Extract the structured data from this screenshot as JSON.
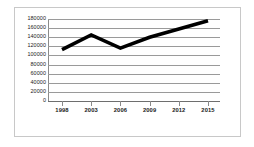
{
  "chart_data": {
    "type": "line",
    "title": "",
    "subtitle": "",
    "xlabel": "",
    "ylabel": "",
    "categories": [
      "1998",
      "2003",
      "2006",
      "2009",
      "2012",
      "2015"
    ],
    "x": [
      1998,
      2003,
      2006,
      2009,
      2012,
      2015
    ],
    "series": [
      {
        "name": "",
        "values": [
          113000,
          145000,
          116000,
          140000,
          158000,
          176000
        ]
      }
    ],
    "values": [
      113000,
      145000,
      116000,
      140000,
      158000,
      176000
    ],
    "ylim": [
      0,
      180000
    ],
    "ytick_labels": [
      "180000",
      "160000",
      "140000",
      "120000",
      "100000",
      "80000",
      "60000",
      "40000",
      "20000",
      "0"
    ],
    "ytick_values": [
      180000,
      160000,
      140000,
      120000,
      100000,
      80000,
      60000,
      40000,
      20000,
      0
    ],
    "grid": true,
    "legend": false,
    "legend_position": "none",
    "line_color": "#000000",
    "grid_color": "#9a9a9a",
    "axis_color": "#8a8a8a",
    "frame_color": "#c8c8c8",
    "background_color": "#ffffff"
  }
}
